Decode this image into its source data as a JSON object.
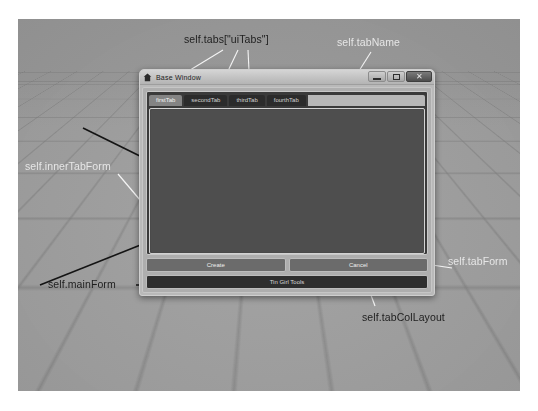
{
  "viewport": {
    "name": "maya-3d-viewport",
    "background_color": "#9c9c9c",
    "grid_color": "#787878"
  },
  "window": {
    "title": "Base Window",
    "title_icon": "home-icon",
    "controls": [
      {
        "name": "minimize",
        "glyph": "–"
      },
      {
        "name": "maximize",
        "glyph": "□"
      },
      {
        "name": "close",
        "glyph": "✕"
      }
    ]
  },
  "tabs": {
    "items": [
      {
        "label": "firstTab",
        "active": true
      },
      {
        "label": "secondTab",
        "active": false
      },
      {
        "label": "thirdTab",
        "active": false
      },
      {
        "label": "fourthTab",
        "active": false
      }
    ]
  },
  "buttons": {
    "create_label": "Create",
    "cancel_label": "Cancel"
  },
  "status": {
    "text": "Tin Girl Tools"
  },
  "annotations": [
    {
      "id": "tabs",
      "text": "self.tabs[\"uiTabs\"]",
      "style": "dark"
    },
    {
      "id": "tabName",
      "text": "self.tabName",
      "style": "light"
    },
    {
      "id": "innerTabForm",
      "text": "self.innerTabForm",
      "style": "light"
    },
    {
      "id": "mainForm",
      "text": "self.mainForm",
      "style": "dark"
    },
    {
      "id": "tabForm",
      "text": "self.tabForm",
      "style": "light"
    },
    {
      "id": "tabColLayout",
      "text": "self.tabColLayout",
      "style": "dark"
    }
  ],
  "colors": {
    "window_chrome": "#b9b9b9",
    "tab_active": "#848484",
    "tab_inactive": "#2b2b2b",
    "content_panel": "#4e4e4e",
    "status_bar": "#2e2e2e"
  }
}
